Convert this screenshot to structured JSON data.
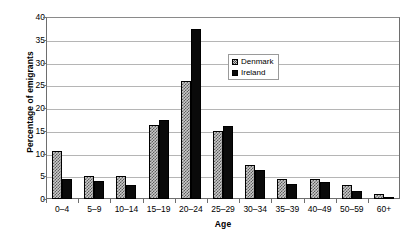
{
  "chart_data": {
    "type": "bar",
    "title": "",
    "xlabel": "Age",
    "ylabel": "Percentage of emigrants",
    "categories": [
      "0–4",
      "5–9",
      "10–14",
      "15–19",
      "20–24",
      "25–29",
      "30–34",
      "35–39",
      "40–49",
      "50–59",
      "60+"
    ],
    "series": [
      {
        "name": "Denmark",
        "pattern": "checkered-grey",
        "values": [
          10.5,
          5.0,
          5.0,
          16.3,
          26.0,
          15.0,
          7.5,
          4.3,
          4.3,
          3.0,
          1.2
        ]
      },
      {
        "name": "Ireland",
        "pattern": "solid-black",
        "values": [
          4.5,
          4.0,
          3.0,
          17.3,
          37.3,
          16.0,
          6.3,
          3.2,
          3.8,
          1.8,
          0.4
        ]
      }
    ],
    "ylim": [
      0,
      40
    ],
    "y_ticks": [
      "40",
      "35",
      "30",
      "25",
      "20",
      "15",
      "10",
      "5",
      "0"
    ],
    "y_tick_values": [
      40,
      35,
      30,
      25,
      20,
      15,
      10,
      5,
      0
    ],
    "grid": true,
    "legend_position": "inside-upper-right"
  },
  "legend": {
    "entries": [
      {
        "label": "Denmark"
      },
      {
        "label": "Ireland"
      }
    ]
  },
  "colors": {
    "denmark_fill": "#c9c9c9",
    "denmark_hatch": "#5d5d5d",
    "ireland_fill": "#0a0a0a",
    "gridline": "#b5b5b5",
    "axis": "#6e6e6e",
    "background": "#ffffff",
    "text": "#000000"
  }
}
